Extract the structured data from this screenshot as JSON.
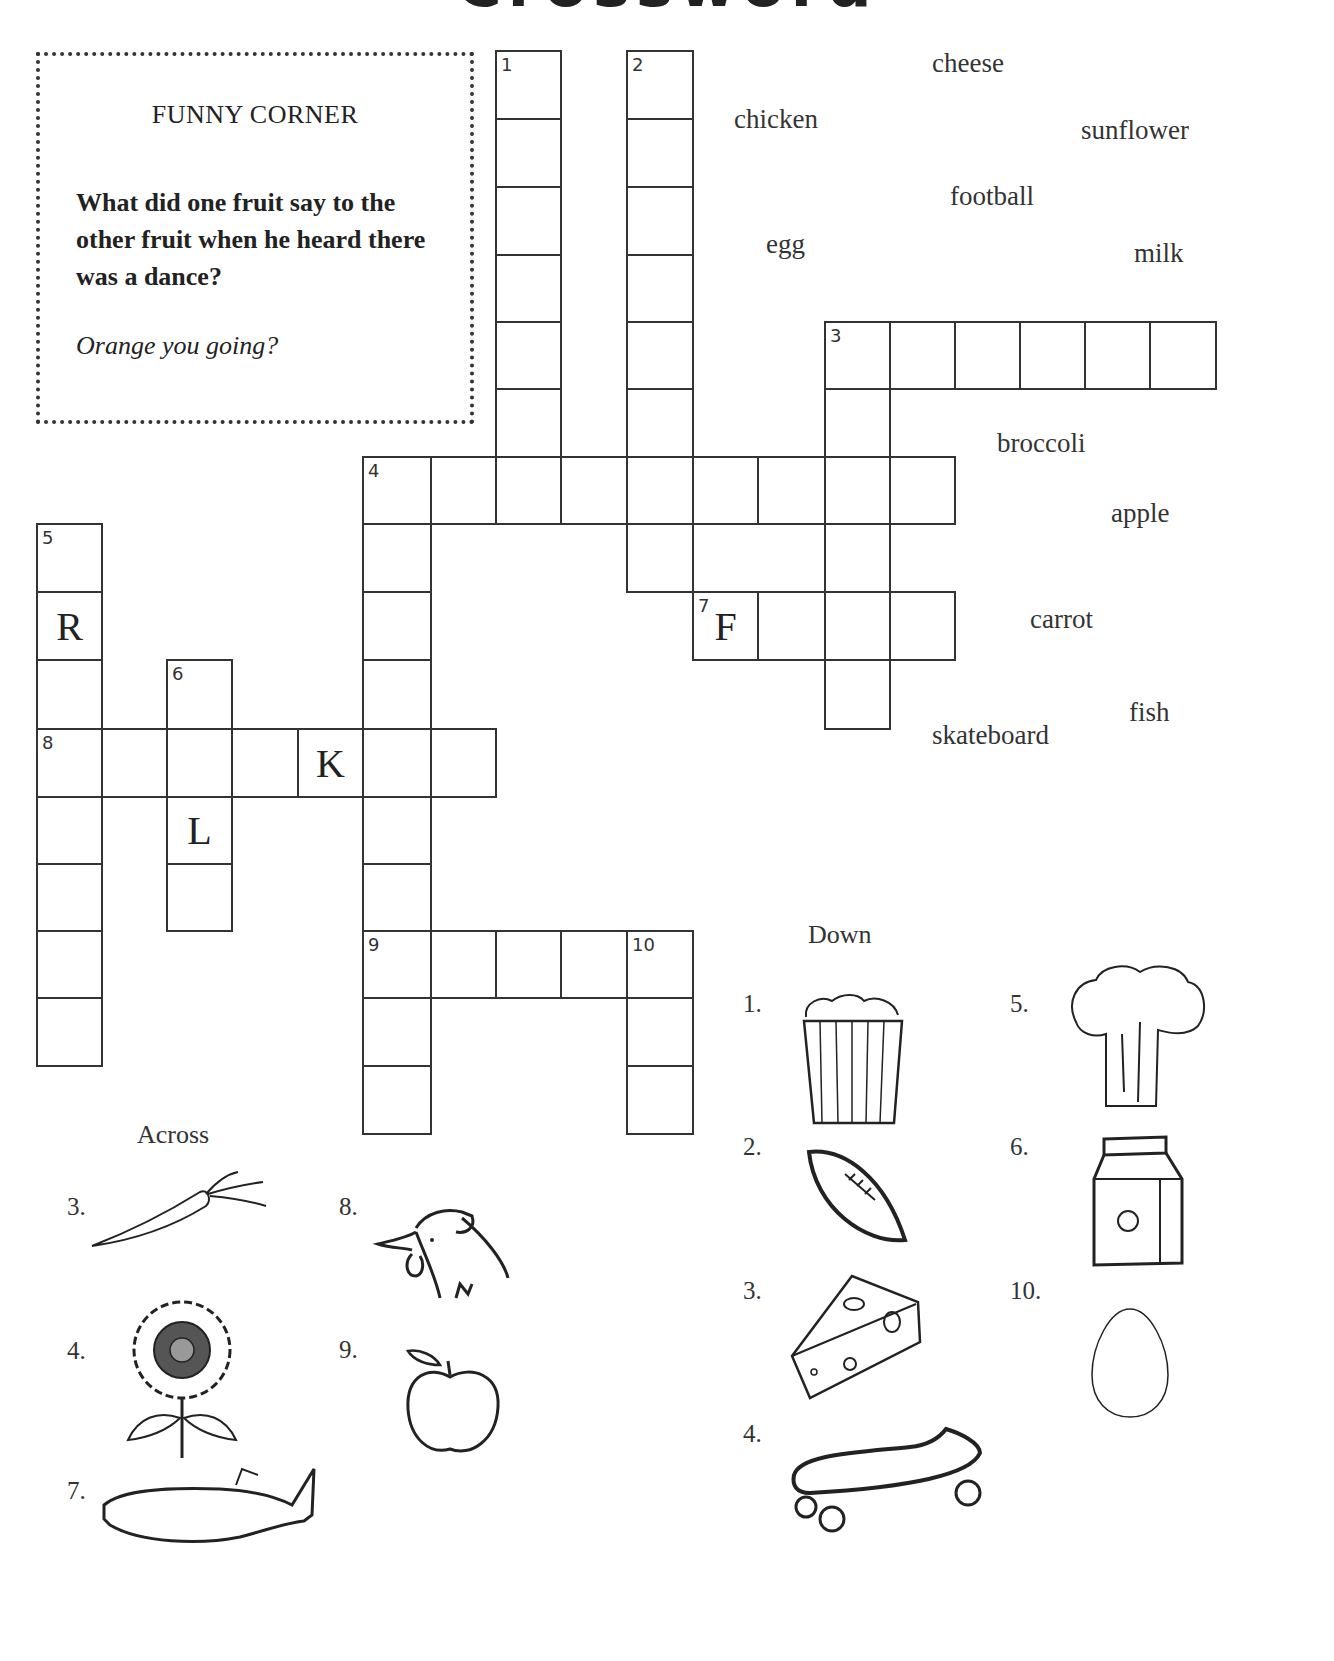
{
  "title": "Crossword",
  "funny_corner": {
    "heading": "FUNNY CORNER",
    "question": "What did one fruit say to the other fruit when he heard there was a dance?",
    "answer": "Orange you going?"
  },
  "grid": {
    "cells": [
      {
        "r": 0,
        "c": 7,
        "num": "1"
      },
      {
        "r": 1,
        "c": 7
      },
      {
        "r": 2,
        "c": 7
      },
      {
        "r": 3,
        "c": 7
      },
      {
        "r": 4,
        "c": 7
      },
      {
        "r": 5,
        "c": 7
      },
      {
        "r": 0,
        "c": 9,
        "num": "2"
      },
      {
        "r": 1,
        "c": 9
      },
      {
        "r": 2,
        "c": 9
      },
      {
        "r": 3,
        "c": 9
      },
      {
        "r": 4,
        "c": 9
      },
      {
        "r": 5,
        "c": 9
      },
      {
        "r": 7,
        "c": 9
      },
      {
        "r": 4,
        "c": 12,
        "num": "3"
      },
      {
        "r": 4,
        "c": 13
      },
      {
        "r": 4,
        "c": 14
      },
      {
        "r": 4,
        "c": 15
      },
      {
        "r": 4,
        "c": 16
      },
      {
        "r": 4,
        "c": 17
      },
      {
        "r": 5,
        "c": 12
      },
      {
        "r": 7,
        "c": 12
      },
      {
        "r": 9,
        "c": 12
      },
      {
        "r": 6,
        "c": 5,
        "num": "4"
      },
      {
        "r": 6,
        "c": 6
      },
      {
        "r": 6,
        "c": 7
      },
      {
        "r": 6,
        "c": 8
      },
      {
        "r": 6,
        "c": 9
      },
      {
        "r": 6,
        "c": 10
      },
      {
        "r": 6,
        "c": 11
      },
      {
        "r": 6,
        "c": 12
      },
      {
        "r": 6,
        "c": 13
      },
      {
        "r": 7,
        "c": 5
      },
      {
        "r": 8,
        "c": 5
      },
      {
        "r": 9,
        "c": 5
      },
      {
        "r": 11,
        "c": 5
      },
      {
        "r": 12,
        "c": 5
      },
      {
        "r": 14,
        "c": 5
      },
      {
        "r": 15,
        "c": 5
      },
      {
        "r": 7,
        "c": 0,
        "num": "5"
      },
      {
        "r": 8,
        "c": 0,
        "letter": "R"
      },
      {
        "r": 9,
        "c": 0
      },
      {
        "r": 11,
        "c": 0
      },
      {
        "r": 12,
        "c": 0
      },
      {
        "r": 13,
        "c": 0
      },
      {
        "r": 14,
        "c": 0
      },
      {
        "r": 9,
        "c": 2,
        "num": "6"
      },
      {
        "r": 11,
        "c": 2,
        "letter": "L"
      },
      {
        "r": 12,
        "c": 2
      },
      {
        "r": 8,
        "c": 10,
        "num": "7",
        "letter": "F"
      },
      {
        "r": 8,
        "c": 11
      },
      {
        "r": 8,
        "c": 12
      },
      {
        "r": 8,
        "c": 13
      },
      {
        "r": 10,
        "c": 0,
        "num": "8"
      },
      {
        "r": 10,
        "c": 1
      },
      {
        "r": 10,
        "c": 2
      },
      {
        "r": 10,
        "c": 3
      },
      {
        "r": 10,
        "c": 4,
        "letter": "K"
      },
      {
        "r": 10,
        "c": 5
      },
      {
        "r": 10,
        "c": 6
      },
      {
        "r": 13,
        "c": 5,
        "num": "9"
      },
      {
        "r": 13,
        "c": 6
      },
      {
        "r": 13,
        "c": 7
      },
      {
        "r": 13,
        "c": 8
      },
      {
        "r": 13,
        "c": 9,
        "num": "10"
      },
      {
        "r": 14,
        "c": 9
      },
      {
        "r": 15,
        "c": 9
      }
    ]
  },
  "word_bank": [
    {
      "word": "cheese",
      "x": 932,
      "y": 48
    },
    {
      "word": "chicken",
      "x": 734,
      "y": 104
    },
    {
      "word": "sunflower",
      "x": 1081,
      "y": 115
    },
    {
      "word": "football",
      "x": 950,
      "y": 181
    },
    {
      "word": "egg",
      "x": 766,
      "y": 229
    },
    {
      "word": "milk",
      "x": 1134,
      "y": 238
    },
    {
      "word": "broccoli",
      "x": 997,
      "y": 428
    },
    {
      "word": "apple",
      "x": 1111,
      "y": 498
    },
    {
      "word": "carrot",
      "x": 1030,
      "y": 604
    },
    {
      "word": "fish",
      "x": 1129,
      "y": 697
    },
    {
      "word": "skateboard",
      "x": 932,
      "y": 720
    }
  ],
  "across": {
    "heading": "Across",
    "clues": [
      {
        "num": "3.",
        "picture": "carrot"
      },
      {
        "num": "4.",
        "picture": "sunflower"
      },
      {
        "num": "7.",
        "picture": "fish"
      },
      {
        "num": "8.",
        "picture": "chicken"
      },
      {
        "num": "9.",
        "picture": "apple"
      }
    ]
  },
  "down": {
    "heading": "Down",
    "clues": [
      {
        "num": "1.",
        "picture": "popcorn"
      },
      {
        "num": "2.",
        "picture": "football"
      },
      {
        "num": "3.",
        "picture": "cheese"
      },
      {
        "num": "4.",
        "picture": "skateboard"
      },
      {
        "num": "5.",
        "picture": "broccoli"
      },
      {
        "num": "6.",
        "picture": "milk-carton"
      },
      {
        "num": "10.",
        "picture": "egg"
      }
    ]
  }
}
